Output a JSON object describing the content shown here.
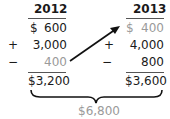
{
  "columns": [
    {
      "year": "2012",
      "beginning_label": "$",
      "beginning_value": "600",
      "add_sign": "+",
      "add_value": "3,000",
      "sub_sign": "−",
      "sub_value": "400",
      "total": "$3,200"
    },
    {
      "year": "2013",
      "beginning_label": "$",
      "beginning_value": "400",
      "add_sign": "+",
      "add_value": "4,000",
      "sub_sign": "−",
      "sub_value": "800",
      "total": "$3,600"
    }
  ],
  "combined_total": "$6,800",
  "colors": {
    "text": "#1a1a1a",
    "muted": "#9a9a9a",
    "arrow": "#111111"
  }
}
